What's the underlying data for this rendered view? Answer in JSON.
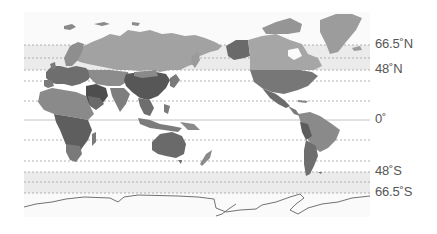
{
  "map": {
    "projection": "world map centered on Pacific (Eurasia left, Americas right)",
    "colors": {
      "background": "#ffffff",
      "polar_band": "#ebebeb",
      "gridline": "#9a9a9a",
      "equator": "#c8c8c8",
      "land_light": "#9a9a9a",
      "land_mid": "#7d7d7d",
      "land_dark": "#5a5a5a",
      "antarctica_outline": "#707070"
    },
    "latitude_labels": [
      {
        "id": "arctic",
        "text": "66.5˚N",
        "y": 45
      },
      {
        "id": "north48",
        "text": "48˚N",
        "y": 70
      },
      {
        "id": "equator",
        "text": "0˚",
        "y": 120
      },
      {
        "id": "south48",
        "text": "48˚S",
        "y": 172
      },
      {
        "id": "antarctic",
        "text": "66.5˚S",
        "y": 193
      }
    ]
  }
}
